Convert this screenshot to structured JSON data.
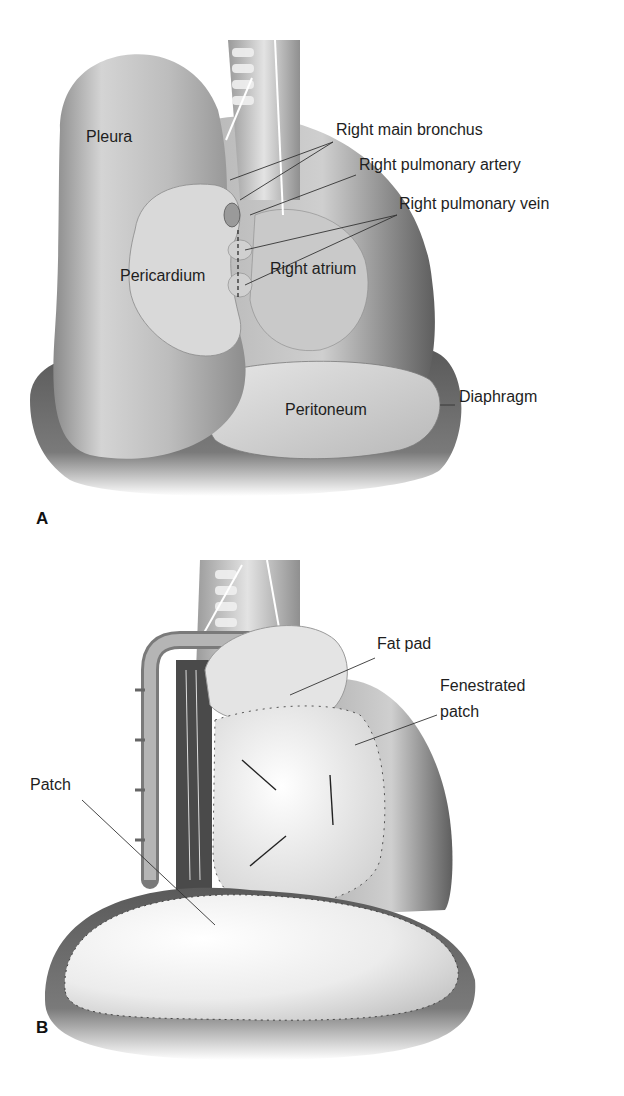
{
  "figure": {
    "panels": [
      {
        "letter": "A",
        "labels": {
          "pleura": "Pleura",
          "right_main_bronchus": "Right main bronchus",
          "right_pulmonary_artery": "Right pulmonary artery",
          "right_pulmonary_vein": "Right pulmonary vein",
          "pericardium": "Pericardium",
          "right_atrium": "Right atrium",
          "peritoneum": "Peritoneum",
          "diaphragm": "Diaphragm"
        }
      },
      {
        "letter": "B",
        "labels": {
          "fat_pad": "Fat pad",
          "fenestrated_patch_line1": "Fenestrated",
          "fenestrated_patch_line2": "patch",
          "patch": "Patch"
        }
      }
    ]
  }
}
